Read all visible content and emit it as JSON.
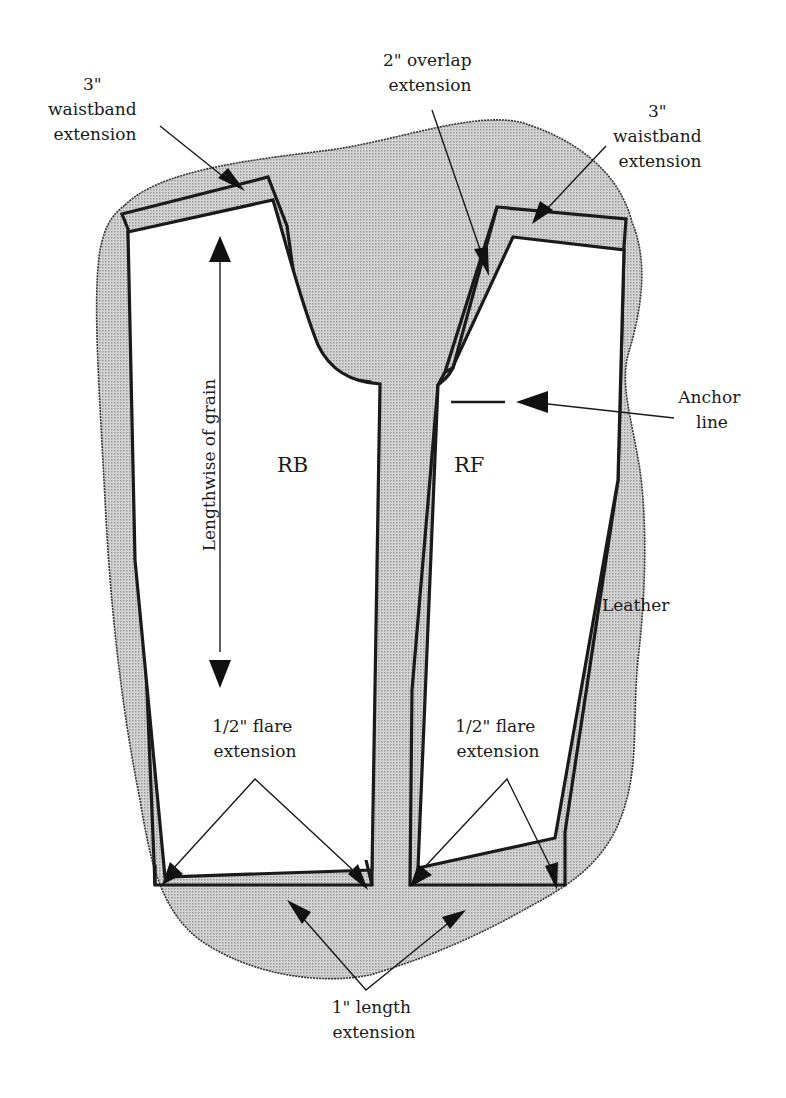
{
  "diagram": {
    "colors": {
      "leather_fill": "#c6c6c6",
      "outline": "#1a1a1a",
      "background": "#ffffff"
    },
    "material_label": "Leather",
    "pieces": [
      {
        "id": "RB",
        "label": "RB"
      },
      {
        "id": "RF",
        "label": "RF"
      }
    ],
    "grain": {
      "label": "Lengthwise of grain"
    },
    "callouts": {
      "waistband_left": {
        "line1": "3\"",
        "line2": "waistband",
        "line3": "extension"
      },
      "overlap": {
        "line1": "2\" overlap",
        "line2": "extension"
      },
      "waistband_right": {
        "line1": "3\"",
        "line2": "waistband",
        "line3": "extension"
      },
      "anchor": {
        "line1": "Anchor",
        "line2": "line"
      },
      "flare_left": {
        "line1": "1/2\" flare",
        "line2": "extension"
      },
      "flare_right": {
        "line1": "1/2\" flare",
        "line2": "extension"
      },
      "length": {
        "line1": "1\" length",
        "line2": "extension"
      }
    }
  }
}
